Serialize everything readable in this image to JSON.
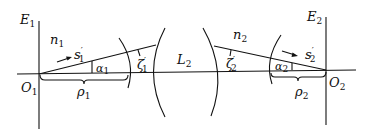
{
  "diagram": {
    "type": "optical-ray-diagram",
    "planes": [
      {
        "id": "E1",
        "label": "E",
        "sub": "1"
      },
      {
        "id": "E2",
        "label": "E",
        "sub": "2"
      }
    ],
    "points": [
      {
        "id": "O1",
        "label": "O",
        "sub": "1"
      },
      {
        "id": "O2",
        "label": "O",
        "sub": "2"
      }
    ],
    "media": [
      {
        "id": "n1",
        "label": "n",
        "sub": "1"
      },
      {
        "id": "n2",
        "label": "n",
        "sub": "2"
      }
    ],
    "lens": {
      "label": "L",
      "sub": "2"
    },
    "rays": [
      {
        "id": "s1",
        "label": "s",
        "prime": "′",
        "sub": "1"
      },
      {
        "id": "s2",
        "label": "s",
        "prime": "′",
        "sub": "2"
      }
    ],
    "angles": [
      {
        "id": "alpha1",
        "label": "α",
        "sub": "1"
      },
      {
        "id": "alpha2",
        "label": "α",
        "sub": "2"
      },
      {
        "id": "zeta1",
        "label": "ζ",
        "prime": "′",
        "sub": "1"
      },
      {
        "id": "zeta2",
        "label": "ζ",
        "prime": "′",
        "sub": "2"
      }
    ],
    "distances": [
      {
        "id": "rho1",
        "label": "ρ",
        "sub": "1"
      },
      {
        "id": "rho2",
        "label": "ρ",
        "sub": "2"
      }
    ]
  }
}
